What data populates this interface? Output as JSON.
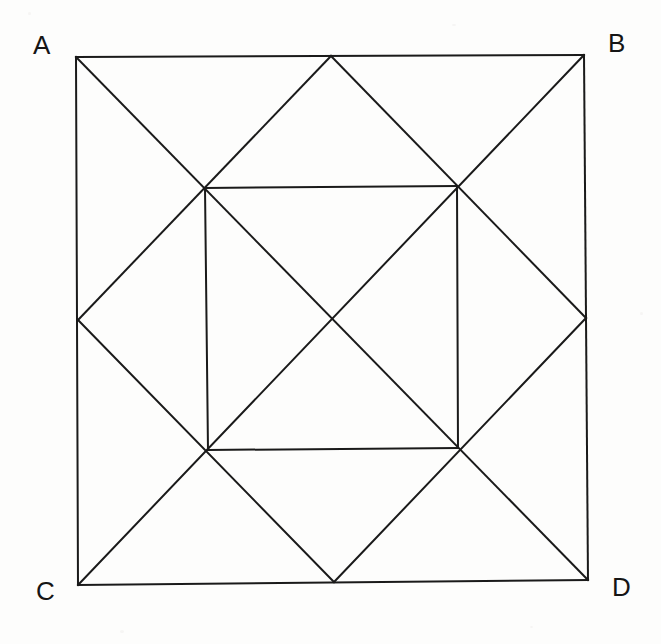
{
  "figure": {
    "background_color": "#fdfdfc",
    "stroke_color": "#1a1a1a",
    "stroke_width": 2,
    "canvas": {
      "width": 661,
      "height": 644
    }
  },
  "labels": {
    "a": "A",
    "b": "B",
    "c": "C",
    "d": "D"
  },
  "points": {
    "A": {
      "x": 76,
      "y": 57,
      "name": "top-left-corner"
    },
    "B": {
      "x": 584,
      "y": 55,
      "name": "top-right-corner"
    },
    "C": {
      "x": 78,
      "y": 585,
      "name": "bottom-left-corner"
    },
    "D": {
      "x": 588,
      "y": 580,
      "name": "bottom-right-corner"
    },
    "M_top": {
      "x": 331,
      "y": 56,
      "name": "top-edge-midpoint"
    },
    "M_right": {
      "x": 586,
      "y": 318,
      "name": "right-edge-midpoint"
    },
    "M_bottom": {
      "x": 334,
      "y": 582,
      "name": "bottom-edge-midpoint"
    },
    "M_left": {
      "x": 78,
      "y": 320,
      "name": "left-edge-midpoint"
    },
    "I_tl": {
      "x": 205,
      "y": 188,
      "name": "inner-square-top-left"
    },
    "I_tr": {
      "x": 457,
      "y": 186,
      "name": "inner-square-top-right"
    },
    "I_bl": {
      "x": 208,
      "y": 450,
      "name": "inner-square-bottom-left"
    },
    "I_br": {
      "x": 458,
      "y": 448,
      "name": "inner-square-bottom-right"
    },
    "O": {
      "x": 333,
      "y": 318,
      "name": "center"
    }
  },
  "segments": [
    {
      "id": "outer-top",
      "from": "A",
      "to": "B",
      "name": "outer-square-top-edge"
    },
    {
      "id": "outer-right",
      "from": "B",
      "to": "D",
      "name": "outer-square-right-edge"
    },
    {
      "id": "outer-bottom",
      "from": "C",
      "to": "D",
      "name": "outer-square-bottom-edge"
    },
    {
      "id": "outer-left",
      "from": "A",
      "to": "C",
      "name": "outer-square-left-edge"
    },
    {
      "id": "diagonal-AD",
      "from": "A",
      "to": "D",
      "name": "main-diagonal-a-d"
    },
    {
      "id": "diagonal-BC",
      "from": "B",
      "to": "C",
      "name": "main-diagonal-b-c"
    },
    {
      "id": "diamond-tl",
      "from": "M_top",
      "to": "M_left",
      "name": "midpoint-diamond-upper-left-side"
    },
    {
      "id": "diamond-tr",
      "from": "M_top",
      "to": "M_right",
      "name": "midpoint-diamond-upper-right-side"
    },
    {
      "id": "diamond-br",
      "from": "M_right",
      "to": "M_bottom",
      "name": "midpoint-diamond-lower-right-side"
    },
    {
      "id": "diamond-bl",
      "from": "M_bottom",
      "to": "M_left",
      "name": "midpoint-diamond-lower-left-side"
    },
    {
      "id": "inner-top",
      "from": "I_tl",
      "to": "I_tr",
      "name": "inner-square-top-edge"
    },
    {
      "id": "inner-right",
      "from": "I_tr",
      "to": "I_br",
      "name": "inner-square-right-edge"
    },
    {
      "id": "inner-bottom",
      "from": "I_bl",
      "to": "I_br",
      "name": "inner-square-bottom-edge"
    },
    {
      "id": "inner-left",
      "from": "I_tl",
      "to": "I_bl",
      "name": "inner-square-left-edge"
    }
  ]
}
